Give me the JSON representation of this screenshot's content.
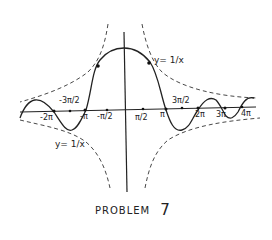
{
  "diagram": {
    "title": "PROBLEM",
    "problem_number": "7",
    "curve_description": "y = sin(x)/x style damped wave bounded by y = 1/x and y = -1/x envelopes",
    "envelope_labels": {
      "upper_right": "y= 1/x",
      "lower_left": "y= 1/x"
    },
    "axis_labels": [
      {
        "text": "-2π",
        "x": 40,
        "y": 114
      },
      {
        "text": "-3π/2",
        "x": 59,
        "y": 98
      },
      {
        "text": "-π",
        "x": 80,
        "y": 113
      },
      {
        "text": "-π/2",
        "x": 97,
        "y": 114
      },
      {
        "text": "π/2",
        "x": 136,
        "y": 116
      },
      {
        "text": "π",
        "x": 160,
        "y": 112
      },
      {
        "text": "3π/2",
        "x": 172,
        "y": 98
      },
      {
        "text": "2π",
        "x": 195,
        "y": 112
      },
      {
        "text": "3π",
        "x": 216,
        "y": 112
      },
      {
        "text": "4π",
        "x": 242,
        "y": 111
      }
    ],
    "colors": {
      "ink": "#222222",
      "background": "#ffffff"
    }
  }
}
